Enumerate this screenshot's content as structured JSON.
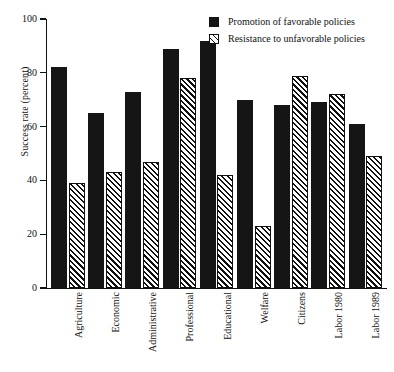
{
  "chart_data": {
    "type": "bar",
    "title": "",
    "xlabel": "",
    "ylabel": "Success rate (percent)",
    "ylim": [
      0,
      100
    ],
    "yticks": [
      0,
      20,
      40,
      60,
      80,
      100
    ],
    "ytick_labels": [
      "0",
      "20",
      "40",
      "60",
      "80",
      "100"
    ],
    "grid": false,
    "legend_position": "top-right",
    "categories": [
      "Agriculture",
      "Economic",
      "Administrative",
      "Professional",
      "Educational",
      "Welfare",
      "Citizens",
      "Labor 1980",
      "Labor 1989"
    ],
    "series": [
      {
        "name": "Promotion of favorable policies",
        "style": "solid-black",
        "color": "#151515",
        "values": [
          82,
          65,
          73,
          89,
          92,
          70,
          68,
          69,
          61
        ]
      },
      {
        "name": "Resistance to unfavorable policies",
        "style": "diagonal-hatch",
        "color": "#ffffff",
        "values": [
          39,
          43,
          47,
          78,
          42,
          23,
          79,
          72,
          49
        ]
      }
    ]
  },
  "legend": {
    "items": [
      {
        "label": "Promotion of favorable policies",
        "marker": "filled-square-icon"
      },
      {
        "label": "Resistance to unfavorable policies",
        "marker": "hatched-square-icon"
      }
    ]
  }
}
